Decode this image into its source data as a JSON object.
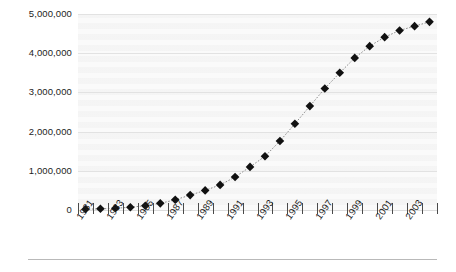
{
  "chart_data": {
    "type": "line",
    "title": "",
    "subtitle": "",
    "xlabel": "",
    "ylabel": "",
    "grid": true,
    "legend": false,
    "marker": "diamond",
    "marker_color": "#111111",
    "line_style": "dotted",
    "line_color": "#8d8d8d",
    "plot_bg": "#f4f4f4",
    "ylim": [
      0,
      5000000
    ],
    "xlim": [
      1981,
      2005
    ],
    "y_ticks": [
      0,
      1000000,
      2000000,
      3000000,
      4000000,
      5000000
    ],
    "y_tick_labels": [
      "0",
      "1,000,000",
      "2,000,000",
      "3,000,000",
      "4,000,000",
      "5,000,000"
    ],
    "x_tick_values": [
      1981,
      1982,
      1983,
      1984,
      1985,
      1986,
      1987,
      1988,
      1989,
      1990,
      1991,
      1992,
      1993,
      1994,
      1995,
      1996,
      1997,
      1998,
      1999,
      2000,
      2001,
      2002,
      2003,
      2004,
      2005
    ],
    "x_tick_labels": [
      "1981",
      "",
      "1983",
      "",
      "1985",
      "",
      "1987",
      "",
      "1989",
      "",
      "1991",
      "",
      "1993",
      "",
      "1995",
      "",
      "1997",
      "",
      "1999",
      "",
      "2001",
      "",
      "2003",
      "",
      ""
    ],
    "x_labeled_years": [
      "1981",
      "1983",
      "1985",
      "1987",
      "1989",
      "1991",
      "1993",
      "1995",
      "1997",
      "1999",
      "2001",
      "2003"
    ],
    "categories": [
      1981,
      1982,
      1983,
      1984,
      1985,
      1986,
      1987,
      1988,
      1989,
      1990,
      1991,
      1992,
      1993,
      1994,
      1995,
      1996,
      1997,
      1998,
      1999,
      2000,
      2001,
      2002,
      2003,
      2004
    ],
    "values": [
      20000,
      30000,
      45000,
      70000,
      110000,
      170000,
      260000,
      380000,
      500000,
      640000,
      840000,
      1100000,
      1370000,
      1760000,
      2200000,
      2650000,
      3100000,
      3500000,
      3880000,
      4180000,
      4410000,
      4580000,
      4690000,
      4800000
    ]
  }
}
